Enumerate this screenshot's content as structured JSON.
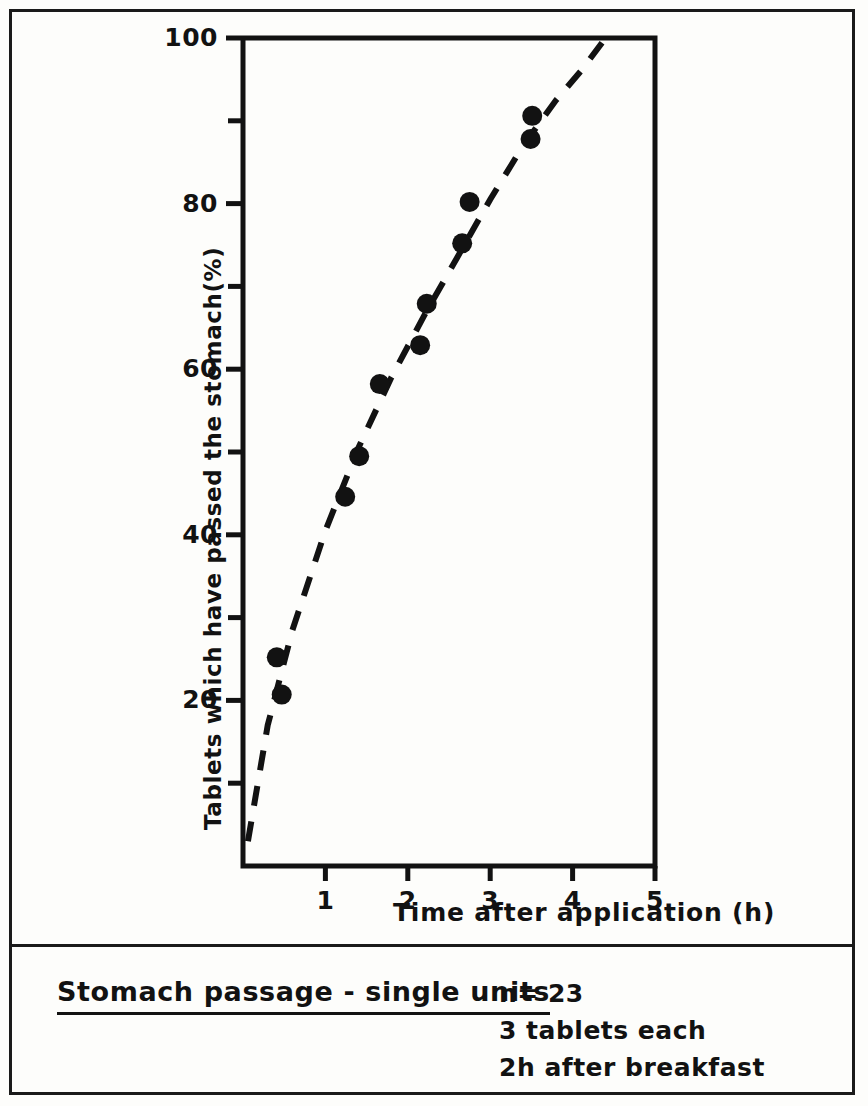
{
  "figure": {
    "caption_title": "Stomach passage - single units",
    "notes": [
      "n= 23",
      "3 tablets each",
      "2h after breakfast"
    ]
  },
  "chart_data": {
    "type": "scatter",
    "title": "Stomach passage - single units",
    "xlabel": "Time after application  (h)",
    "ylabel": "Tablets which have passed the stomach(%)",
    "xlim": [
      0,
      5
    ],
    "ylim": [
      0,
      100
    ],
    "xticks": [
      1,
      2,
      3,
      4,
      5
    ],
    "xtick_labels": [
      "1",
      "2",
      "3",
      "4",
      "5"
    ],
    "yticks": [
      20,
      40,
      60,
      80,
      100
    ],
    "ytick_labels": [
      "20",
      "40",
      "60",
      "80",
      "100"
    ],
    "yticks_minor": [
      10,
      30,
      50,
      70,
      90
    ],
    "grid": false,
    "legend": null,
    "series": [
      {
        "name": "observed",
        "marker": "filled-circle",
        "color": "#121212",
        "points": [
          {
            "x": 0.41,
            "y": 25.2
          },
          {
            "x": 0.47,
            "y": 20.7
          },
          {
            "x": 1.24,
            "y": 44.6
          },
          {
            "x": 1.41,
            "y": 49.5
          },
          {
            "x": 1.66,
            "y": 58.2
          },
          {
            "x": 2.15,
            "y": 62.9
          },
          {
            "x": 2.23,
            "y": 67.9
          },
          {
            "x": 2.66,
            "y": 75.2
          },
          {
            "x": 2.75,
            "y": 80.2
          },
          {
            "x": 3.49,
            "y": 87.8
          },
          {
            "x": 3.51,
            "y": 90.6
          }
        ]
      },
      {
        "name": "fitted-curve",
        "style": "dashed",
        "color": "#121212",
        "points": [
          {
            "x": 0.06,
            "y": 3.0
          },
          {
            "x": 0.3,
            "y": 17.0
          },
          {
            "x": 0.6,
            "y": 28.5
          },
          {
            "x": 1.0,
            "y": 40.5
          },
          {
            "x": 1.4,
            "y": 50.5
          },
          {
            "x": 1.8,
            "y": 59.0
          },
          {
            "x": 2.2,
            "y": 66.5
          },
          {
            "x": 2.6,
            "y": 73.5
          },
          {
            "x": 3.0,
            "y": 80.5
          },
          {
            "x": 3.4,
            "y": 87.0
          },
          {
            "x": 3.8,
            "y": 92.5
          },
          {
            "x": 4.1,
            "y": 96.0
          },
          {
            "x": 4.4,
            "y": 100.0
          }
        ]
      }
    ]
  },
  "colors": {
    "ink": "#121212",
    "paper": "#fdfdfb"
  }
}
